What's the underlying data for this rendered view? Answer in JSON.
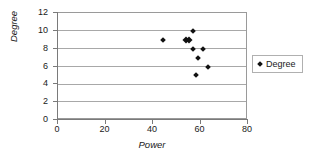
{
  "chart_data": {
    "type": "scatter",
    "title": "",
    "xlabel": "Power",
    "ylabel": "Degree",
    "xlim": [
      0,
      80
    ],
    "ylim": [
      0,
      12
    ],
    "xticks": [
      0,
      20,
      40,
      60,
      80
    ],
    "yticks": [
      0,
      2,
      4,
      6,
      8,
      10,
      12
    ],
    "grid": "horizontal",
    "legend_position": "right",
    "series": [
      {
        "name": "Degree",
        "marker": "diamond",
        "color": "#111111",
        "points": [
          {
            "x": 44,
            "y": 9
          },
          {
            "x": 54,
            "y": 9
          },
          {
            "x": 55,
            "y": 9
          },
          {
            "x": 57,
            "y": 10
          },
          {
            "x": 57,
            "y": 8
          },
          {
            "x": 58,
            "y": 5
          },
          {
            "x": 59,
            "y": 7
          },
          {
            "x": 61,
            "y": 8
          },
          {
            "x": 63,
            "y": 6
          }
        ]
      }
    ]
  },
  "legend": {
    "entries": [
      {
        "label": "Degree"
      }
    ]
  },
  "colors": {
    "marker": "#111111",
    "gridline": "#a8a8a8",
    "axis": "#7a7a7a",
    "plot_border": "#9a9a9a",
    "background": "#ffffff",
    "text": "#1a1a1a"
  }
}
